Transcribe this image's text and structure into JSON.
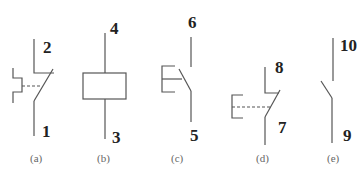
{
  "symbols": [
    {
      "id": "a",
      "caption": "(a)",
      "top_label": "2",
      "bottom_label": "1",
      "type": "manual-push-button-normally-closed"
    },
    {
      "id": "b",
      "caption": "(b)",
      "top_label": "4",
      "bottom_label": "3",
      "type": "coil"
    },
    {
      "id": "c",
      "caption": "(c)",
      "top_label": "6",
      "bottom_label": "5",
      "type": "push-button-normally-open"
    },
    {
      "id": "d",
      "caption": "(d)",
      "top_label": "8",
      "bottom_label": "7",
      "type": "push-button-normally-closed"
    },
    {
      "id": "e",
      "caption": "(e)",
      "top_label": "10",
      "bottom_label": "9",
      "type": "normally-open-contact"
    }
  ],
  "colors": {
    "line": "#555555",
    "text": "#222222",
    "caption": "#666666"
  }
}
